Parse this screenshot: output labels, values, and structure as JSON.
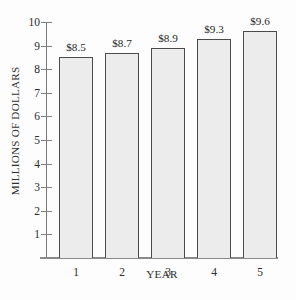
{
  "chart_data": {
    "type": "bar",
    "title": "",
    "xlabel": "YEAR",
    "ylabel": "MILLIONS OF DOLLARS",
    "categories": [
      "1",
      "2",
      "3",
      "4",
      "5"
    ],
    "values": [
      8.5,
      8.7,
      8.9,
      9.3,
      9.6
    ],
    "data_labels": [
      "$8.5",
      "$8.7",
      "$8.9",
      "$9.3",
      "$9.6"
    ],
    "ylim": [
      0,
      10
    ],
    "y_ticks": [
      10,
      9,
      8,
      7,
      6,
      5,
      4,
      3,
      2,
      1
    ],
    "y_tick_labels": [
      "10",
      "9",
      "8",
      "7",
      "6",
      "5",
      "4",
      "3",
      "2",
      "1"
    ],
    "grid": false,
    "legend": false,
    "legend_position": "none",
    "bar_fill_color": "#ececec",
    "bar_border_color": "#4a4a4a",
    "axis_color": "#808080",
    "text_color": "#2b2b2b",
    "background_color": "#fdfdfd"
  }
}
